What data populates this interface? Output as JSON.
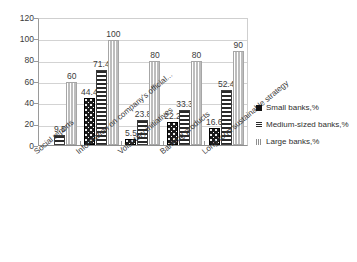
{
  "chart_data": {
    "type": "bar",
    "title": "",
    "xlabel": "",
    "ylabel": "",
    "ylim": [
      0,
      120
    ],
    "yticks": [
      0,
      20,
      40,
      60,
      80,
      100,
      120
    ],
    "grid": true,
    "legend_position": "right",
    "categories": [
      "Social reports",
      "Information on company's official...",
      "Voluntary initiatives",
      "Banking products",
      "Long-term sustainable strategy"
    ],
    "series": [
      {
        "name": "Small banks,%",
        "pattern": "dotted-black",
        "values": [
          0,
          44.4,
          5.5,
          22.2,
          16.6
        ],
        "labels": [
          "",
          "44.4",
          "5.5",
          "22.2",
          "16.6"
        ]
      },
      {
        "name": "Medium-sized banks,%",
        "pattern": "horizontal-lines",
        "values": [
          9.5,
          71.4,
          23.8,
          33.3,
          52.4
        ],
        "labels": [
          "9.5",
          "71.4",
          "23.8",
          "33.3",
          "52.4"
        ]
      },
      {
        "name": "Large banks,%",
        "pattern": "vertical-lines",
        "values": [
          60,
          100,
          80,
          80,
          90
        ],
        "labels": [
          "60",
          "100",
          "80",
          "80",
          "90"
        ]
      }
    ]
  },
  "legend": {
    "items": [
      {
        "label": "Small banks,%"
      },
      {
        "label": "Medium-sized banks,%"
      },
      {
        "label": "Large banks,%"
      }
    ]
  },
  "axis": {
    "y_tick_labels": [
      "120",
      "100",
      "80",
      "60",
      "40",
      "20",
      "0"
    ]
  }
}
